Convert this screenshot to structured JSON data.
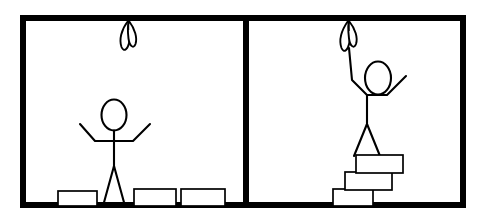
{
  "scene": {
    "title": "Two-panel stick figure comic: unreachable object solved by stacking boxes",
    "background_color": "#ffffff",
    "ink_color": "#000000",
    "frame_color": "#000000",
    "fill_color": "#ffffff"
  },
  "frame": {
    "outer_x": 20,
    "outer_y": 15,
    "outer_width": 446,
    "outer_height": 193,
    "border_width": 6,
    "divider_x": 243,
    "divider_width": 6
  },
  "panels": [
    {
      "id": "panel-left",
      "label": "Panel 1",
      "caption": "Stick figure standing on the floor with arms spread, unable to reach the object hanging from the ceiling. Three boxes rest on the floor.",
      "x": 23,
      "y": 18,
      "width": 220,
      "height": 187
    },
    {
      "id": "panel-right",
      "label": "Panel 2",
      "caption": "Stick figure standing on a staircase of three stacked boxes, one arm raised, touching the hanging object.",
      "x": 249,
      "y": 18,
      "width": 214,
      "height": 187
    }
  ],
  "hanging_objects": [
    {
      "id": "hanging-object-left",
      "name": "hanging plant with two leaves",
      "leaf_count": 2,
      "anchor_x": 128,
      "anchor_y": 18,
      "bottom_y": 50,
      "reachable": false
    },
    {
      "id": "hanging-object-right",
      "name": "hanging plant with two leaves",
      "leaf_count": 2,
      "anchor_x": 350,
      "anchor_y": 18,
      "bottom_y": 52,
      "reachable": true
    }
  ],
  "figures": [
    {
      "id": "figure-left",
      "pose": "both arms spread outward and slightly raised",
      "head_center_x": 114,
      "head_center_y": 115,
      "head_rx": 12,
      "head_ry": 15,
      "neck_y": 130,
      "hip_y": 166,
      "shoulder_y": 141,
      "foot_y": 205,
      "standing_on": "floor",
      "reaches_object": false
    },
    {
      "id": "figure-right",
      "pose": "left arm raised overhead touching the object, right arm angled down-outward",
      "head_center_x": 378,
      "head_center_y": 78,
      "head_rx": 13,
      "head_ry": 16,
      "neck_y": 94,
      "hip_y": 124,
      "shoulder_y": 99,
      "foot_y": 160,
      "standing_on": "stacked-boxes",
      "reaches_object": true
    }
  ],
  "boxes_floor": [
    {
      "id": "floor-box-1",
      "x": 58,
      "y": 192,
      "width": 38,
      "height": 14
    },
    {
      "id": "floor-box-2",
      "x": 134,
      "y": 189,
      "width": 41,
      "height": 17
    },
    {
      "id": "floor-box-3",
      "x": 180,
      "y": 189,
      "width": 44,
      "height": 17
    }
  ],
  "boxes_stack": [
    {
      "id": "stack-box-bottom",
      "level": 1,
      "x": 334,
      "y": 189,
      "width": 40,
      "height": 17
    },
    {
      "id": "stack-box-middle",
      "level": 2,
      "x": 346,
      "y": 172,
      "width": 46,
      "height": 18
    },
    {
      "id": "stack-box-top",
      "level": 3,
      "x": 357,
      "y": 155,
      "width": 46,
      "height": 18
    }
  ],
  "floors": [
    {
      "id": "floor-left",
      "x1": 23,
      "x2": 243,
      "y": 205
    },
    {
      "id": "floor-right",
      "x1": 249,
      "x2": 463,
      "y": 205
    }
  ]
}
